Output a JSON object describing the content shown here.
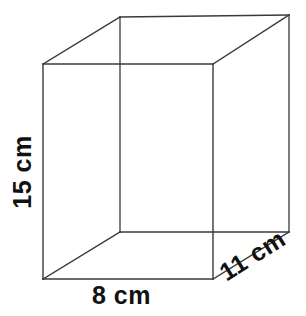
{
  "figure": {
    "name": "rectangular-prism",
    "type": "3d-geometry-diagram",
    "background_color": "#ffffff",
    "line_color": "#3a3a3a",
    "text_color": "#111111"
  },
  "labels": {
    "height": "15 cm",
    "width": "8 cm",
    "depth": "11 cm"
  },
  "geometry": {
    "front_face": {
      "top_left": [
        43,
        64
      ],
      "top_right": [
        213,
        64
      ],
      "bottom_right": [
        213,
        279
      ],
      "bottom_left": [
        43,
        279
      ]
    },
    "back_face": {
      "top_left": [
        120,
        17
      ],
      "top_right": [
        289,
        15
      ],
      "bottom_right": [
        289,
        232
      ],
      "bottom_left": [
        120,
        232
      ]
    }
  },
  "dimensions": {
    "height_value": 15,
    "width_value": 8,
    "depth_value": 11,
    "unit": "cm"
  }
}
